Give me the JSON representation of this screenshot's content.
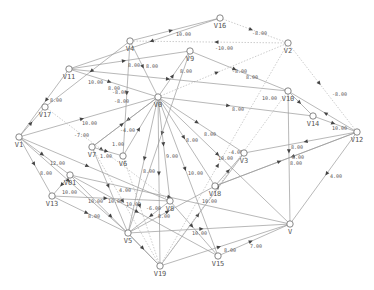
{
  "graph": {
    "title": "",
    "colors": {
      "edge": "#9a9a9a",
      "node_stroke": "#6a6a6a",
      "text": "#555555",
      "arrow": "#444444"
    },
    "nodes": [
      {
        "id": "V16",
        "x": 220,
        "y": 18
      },
      {
        "id": "V2",
        "x": 288,
        "y": 43
      },
      {
        "id": "V4",
        "x": 130,
        "y": 41
      },
      {
        "id": "V9",
        "x": 190,
        "y": 51
      },
      {
        "id": "V11",
        "x": 69,
        "y": 69
      },
      {
        "id": "V17",
        "x": 45,
        "y": 107
      },
      {
        "id": "V0",
        "x": 158,
        "y": 97
      },
      {
        "id": "V10",
        "x": 288,
        "y": 91
      },
      {
        "id": "V14",
        "x": 313,
        "y": 116
      },
      {
        "id": "V12",
        "x": 357,
        "y": 132
      },
      {
        "id": "V1",
        "x": 19,
        "y": 137
      },
      {
        "id": "V7",
        "x": 92,
        "y": 147
      },
      {
        "id": "V6",
        "x": 123,
        "y": 156
      },
      {
        "id": "V3",
        "x": 244,
        "y": 153
      },
      {
        "id": "V01",
        "x": 70,
        "y": 175
      },
      {
        "id": "V13",
        "x": 52,
        "y": 196
      },
      {
        "id": "V18",
        "x": 215,
        "y": 186
      },
      {
        "id": "V8",
        "x": 170,
        "y": 201
      },
      {
        "id": "V5",
        "x": 128,
        "y": 233
      },
      {
        "id": "V",
        "x": 290,
        "y": 224
      },
      {
        "id": "V15",
        "x": 218,
        "y": 256
      },
      {
        "id": "V19",
        "x": 160,
        "y": 266
      }
    ],
    "edges": [
      {
        "from": "V4",
        "to": "V16",
        "label": "10.00",
        "lx": 176,
        "ly": 36,
        "dashed": false
      },
      {
        "from": "V16",
        "to": "V2",
        "label": "-8.00",
        "lx": 252,
        "ly": 35,
        "dashed": true
      },
      {
        "from": "V2",
        "to": "V4",
        "label": "-10.00",
        "lx": 215,
        "ly": 50,
        "dashed": true
      },
      {
        "from": "V11",
        "to": "V9",
        "label": "8.00",
        "lx": 128,
        "ly": 67,
        "dashed": false
      },
      {
        "from": "V4",
        "to": "V0",
        "label": "8.00",
        "lx": 146,
        "ly": 68,
        "dashed": false
      },
      {
        "from": "V0",
        "to": "V9",
        "label": "8.00",
        "lx": 180,
        "ly": 73,
        "dashed": false
      },
      {
        "from": "V9",
        "to": "V10",
        "label": "8.00",
        "lx": 246,
        "ly": 79,
        "dashed": false
      },
      {
        "from": "V0",
        "to": "V2",
        "label": "-8.00",
        "lx": 232,
        "ly": 73,
        "dashed": true
      },
      {
        "from": "V11",
        "to": "V10",
        "label": "10.00",
        "lx": 262,
        "ly": 100,
        "dashed": false
      },
      {
        "from": "V0",
        "to": "V14",
        "label": "8.00",
        "lx": 232,
        "ly": 111,
        "dashed": false
      },
      {
        "from": "V11",
        "to": "V0",
        "label": "10.00",
        "lx": 88,
        "ly": 84,
        "dashed": false
      },
      {
        "from": "V4",
        "to": "V17",
        "label": "8.00",
        "lx": 50,
        "ly": 102,
        "dashed": false
      },
      {
        "from": "V11",
        "to": "V1",
        "label": "",
        "lx": 0,
        "ly": 0,
        "dashed": false
      },
      {
        "from": "V4",
        "to": "V6",
        "label": "8.00",
        "lx": 108,
        "ly": 90,
        "dashed": false
      },
      {
        "from": "V0",
        "to": "V7",
        "label": "-8.00",
        "lx": 114,
        "ly": 103,
        "dashed": false
      },
      {
        "from": "V9",
        "to": "V5",
        "label": "-8.00",
        "lx": 112,
        "ly": 94,
        "dashed": false
      },
      {
        "from": "V1",
        "to": "V0",
        "label": "10.00",
        "lx": 82,
        "ly": 125,
        "dashed": false
      },
      {
        "from": "V17",
        "to": "V8",
        "label": "-7.00",
        "lx": 74,
        "ly": 137,
        "dashed": true
      },
      {
        "from": "V2",
        "to": "V12",
        "label": "-8.00",
        "lx": 332,
        "ly": 96,
        "dashed": true
      },
      {
        "from": "V14",
        "to": "V12",
        "label": "10.00",
        "lx": 332,
        "ly": 130,
        "dashed": false
      },
      {
        "from": "V12",
        "to": "V3",
        "label": "8.00",
        "lx": 291,
        "ly": 149,
        "dashed": false
      },
      {
        "from": "V10",
        "to": "V",
        "label": "8.00",
        "lx": 292,
        "ly": 159,
        "dashed": false
      },
      {
        "from": "V12",
        "to": "V18",
        "label": "8.00",
        "lx": 290,
        "ly": 165,
        "dashed": false
      },
      {
        "from": "V12",
        "to": "V",
        "label": "4.00",
        "lx": 330,
        "ly": 178,
        "dashed": false
      },
      {
        "from": "V0",
        "to": "V3",
        "label": "-4.00",
        "lx": 228,
        "ly": 154,
        "dashed": false
      },
      {
        "from": "V0",
        "to": "V18",
        "label": "10.00",
        "lx": 218,
        "ly": 160,
        "dashed": false
      },
      {
        "from": "V0",
        "to": "V",
        "label": "8.00",
        "lx": 204,
        "ly": 136,
        "dashed": false
      },
      {
        "from": "V0",
        "to": "V15",
        "label": "8.00",
        "lx": 186,
        "ly": 142,
        "dashed": false
      },
      {
        "from": "V0",
        "to": "V8",
        "label": "9.00",
        "lx": 166,
        "ly": 158,
        "dashed": false
      },
      {
        "from": "V0",
        "to": "V19",
        "label": "10.00",
        "lx": 188,
        "ly": 175,
        "dashed": false
      },
      {
        "from": "V0",
        "to": "V5",
        "label": "8.00",
        "lx": 143,
        "ly": 173,
        "dashed": false
      },
      {
        "from": "V7",
        "to": "V0",
        "label": "-4.00",
        "lx": 120,
        "ly": 132,
        "dashed": false
      },
      {
        "from": "V7",
        "to": "V6",
        "label": "1.00",
        "lx": 100,
        "ly": 158,
        "dashed": false
      },
      {
        "from": "V6",
        "to": "V0",
        "label": "1.00",
        "lx": 112,
        "ly": 146,
        "dashed": false
      },
      {
        "from": "V6",
        "to": "V19",
        "label": "",
        "lx": 0,
        "ly": 0,
        "dashed": true
      },
      {
        "from": "V7",
        "to": "V19",
        "label": "",
        "lx": 0,
        "ly": 0,
        "dashed": true
      },
      {
        "from": "V1",
        "to": "V01",
        "label": "12.00",
        "lx": 50,
        "ly": 165,
        "dashed": false
      },
      {
        "from": "V1",
        "to": "V13",
        "label": "8.00",
        "lx": 40,
        "ly": 175,
        "dashed": false
      },
      {
        "from": "V1",
        "to": "V8",
        "label": "4.00",
        "lx": 119,
        "ly": 192,
        "dashed": false
      },
      {
        "from": "V1",
        "to": "V5",
        "label": "",
        "lx": 0,
        "ly": 0,
        "dashed": false
      },
      {
        "from": "V01",
        "to": "V13",
        "label": "10.00",
        "lx": 62,
        "ly": 194,
        "dashed": false
      },
      {
        "from": "V13",
        "to": "V8",
        "label": "10.00",
        "lx": 108,
        "ly": 203,
        "dashed": false
      },
      {
        "from": "V13",
        "to": "V5",
        "label": "8.00",
        "lx": 88,
        "ly": 218,
        "dashed": false
      },
      {
        "from": "V01",
        "to": "V19",
        "label": "10.00",
        "lx": 88,
        "ly": 203,
        "dashed": false
      },
      {
        "from": "V01",
        "to": "V",
        "label": "10.00",
        "lx": 126,
        "ly": 206,
        "dashed": false
      },
      {
        "from": "V01",
        "to": "V15",
        "label": "-6.00",
        "lx": 146,
        "ly": 210,
        "dashed": false
      },
      {
        "from": "V8",
        "to": "V5",
        "label": "8.00",
        "lx": 158,
        "ly": 218,
        "dashed": false
      },
      {
        "from": "V7",
        "to": "V5",
        "label": "",
        "lx": 0,
        "ly": 0,
        "dashed": false
      },
      {
        "from": "V5",
        "to": "V18",
        "label": "",
        "lx": 0,
        "ly": 0,
        "dashed": false
      },
      {
        "from": "V18",
        "to": "V3",
        "label": "",
        "lx": 0,
        "ly": 0,
        "dashed": false
      },
      {
        "from": "V18",
        "to": "V12",
        "label": "",
        "lx": 0,
        "ly": 0,
        "dashed": false
      },
      {
        "from": "V19",
        "to": "V3",
        "label": "10.00",
        "lx": 202,
        "ly": 203,
        "dashed": false
      },
      {
        "from": "V19",
        "to": "V2",
        "label": "",
        "lx": 0,
        "ly": 0,
        "dashed": true
      },
      {
        "from": "V19",
        "to": "V10",
        "label": "",
        "lx": 0,
        "ly": 0,
        "dashed": true
      },
      {
        "from": "V19",
        "to": "V",
        "label": "",
        "lx": 0,
        "ly": 0,
        "dashed": false
      },
      {
        "from": "V15",
        "to": "V",
        "label": "7.00",
        "lx": 250,
        "ly": 248,
        "dashed": false
      },
      {
        "from": "V5",
        "to": "V",
        "label": "8.00",
        "lx": 224,
        "ly": 252,
        "dashed": false
      },
      {
        "from": "V5",
        "to": "V19",
        "label": "",
        "lx": 0,
        "ly": 0,
        "dashed": false
      },
      {
        "from": "V8",
        "to": "V15",
        "label": "10.00",
        "lx": 192,
        "ly": 235,
        "dashed": false
      },
      {
        "from": "V1",
        "to": "V17",
        "label": "",
        "lx": 0,
        "ly": 0,
        "dashed": false
      },
      {
        "from": "V12",
        "to": "V10",
        "label": "",
        "lx": 0,
        "ly": 0,
        "dashed": false
      },
      {
        "from": "V10",
        "to": "V14",
        "label": "",
        "lx": 0,
        "ly": 0,
        "dashed": false
      },
      {
        "from": "V16",
        "to": "V11",
        "label": "",
        "lx": 0,
        "ly": 0,
        "dashed": false
      }
    ]
  }
}
